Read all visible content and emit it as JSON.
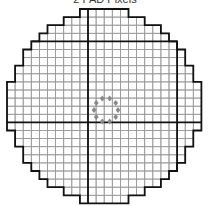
{
  "title": "2 PAD Pixels",
  "grid": {
    "x0": 7,
    "y0": 9,
    "cell": 8.1,
    "cols": 24,
    "rows": 24,
    "row_spans": [
      [
        9,
        15
      ],
      [
        7,
        17
      ],
      [
        5,
        19
      ],
      [
        4,
        20
      ],
      [
        3,
        21
      ],
      [
        2,
        22
      ],
      [
        2,
        22
      ],
      [
        1,
        23
      ],
      [
        1,
        23
      ],
      [
        0,
        24
      ],
      [
        0,
        24
      ],
      [
        0,
        24
      ],
      [
        0,
        24
      ],
      [
        0,
        24
      ],
      [
        0,
        24
      ],
      [
        1,
        23
      ],
      [
        1,
        23
      ],
      [
        2,
        22
      ],
      [
        2,
        22
      ],
      [
        3,
        21
      ],
      [
        4,
        20
      ],
      [
        5,
        19
      ],
      [
        7,
        17
      ],
      [
        9,
        15
      ]
    ],
    "thick_cols": [
      10,
      21
    ],
    "thick_rows": [
      4,
      14
    ],
    "colors": {
      "grid": "#999999",
      "outline": "#111111",
      "thick": "#111111",
      "marker": "#8a8a8a"
    }
  },
  "markers": {
    "center": [
      106,
      110
    ],
    "radius": 12,
    "count": 10,
    "shape": "diamond"
  }
}
